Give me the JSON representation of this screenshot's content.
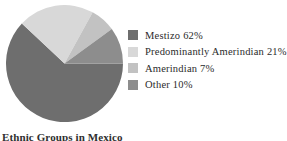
{
  "chart_data": {
    "type": "pie",
    "title": "Ethnic Groups in Mexico",
    "xlabel": "",
    "ylabel": "",
    "legend_position": "right",
    "grid": false,
    "categories": [
      "Mestizo",
      "Predominantly Amerindian",
      "Amerindian",
      "Other"
    ],
    "values": [
      62,
      21,
      7,
      10
    ],
    "unit": "%",
    "slices": [
      {
        "label": "Mestizo",
        "value": 62,
        "legend_text": "Mestizo 62%",
        "color": "#6e6e6e"
      },
      {
        "label": "Predominantly Amerindian",
        "value": 21,
        "legend_text": "Predominantly Amerindian 21%",
        "color": "#d8d8d8"
      },
      {
        "label": "Amerindian",
        "value": 7,
        "legend_text": "Amerindian 7%",
        "color": "#c2c2c2"
      },
      {
        "label": "Other",
        "value": 10,
        "legend_text": "Other 10%",
        "color": "#8d8d8d"
      }
    ]
  },
  "caption": {
    "text": "Ethnic Groups in Mexico"
  }
}
